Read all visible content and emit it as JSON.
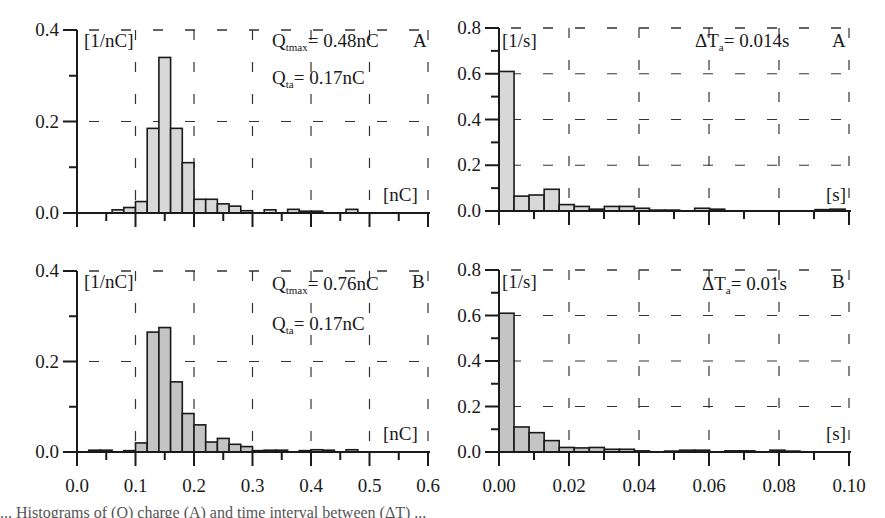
{
  "figure": {
    "caption_fragment": "... Histograms of (Q) charge (A) and time interval between (ΔT) ..."
  },
  "chart_data": [
    {
      "id": "A-charge",
      "type": "bar",
      "panel_letter": "A",
      "ylabel": "[1/nC]",
      "xlabel": "[nC]",
      "xlim": [
        0.0,
        0.6
      ],
      "ylim": [
        0.0,
        0.4
      ],
      "xticks": [
        "0.0",
        "0.1",
        "0.2",
        "0.3",
        "0.4",
        "0.5",
        "0.6"
      ],
      "yticks": [
        "0.0",
        "0.2",
        "0.4"
      ],
      "grid": "dashed",
      "bin_width": 0.02,
      "annotations": [
        {
          "symbol": "Q",
          "sub": "tmax",
          "text": "= 0.48nC"
        },
        {
          "symbol": "Q",
          "sub": "ta",
          "text": "= 0.17nC"
        }
      ],
      "bins_start": [
        0.06,
        0.08,
        0.1,
        0.12,
        0.14,
        0.16,
        0.18,
        0.2,
        0.22,
        0.24,
        0.26,
        0.28,
        0.32,
        0.36,
        0.38,
        0.4,
        0.46
      ],
      "values": [
        0.007,
        0.012,
        0.025,
        0.185,
        0.34,
        0.185,
        0.11,
        0.03,
        0.03,
        0.02,
        0.015,
        0.005,
        0.007,
        0.008,
        0.004,
        0.004,
        0.008
      ],
      "fill": "#d8d8d8"
    },
    {
      "id": "A-interval",
      "type": "bar",
      "panel_letter": "A",
      "ylabel": "[1/s]",
      "xlabel": "[s]",
      "xlim": [
        0.0,
        0.1
      ],
      "ylim": [
        0.0,
        0.8
      ],
      "xticks": [
        "0.00",
        "0.02",
        "0.04",
        "0.06",
        "0.08",
        "0.10"
      ],
      "yticks": [
        "0.0",
        "0.2",
        "0.4",
        "0.6",
        "0.8"
      ],
      "grid": "dashed",
      "bin_width": 0.0043,
      "annotations": [
        {
          "symbol": "ΔT",
          "sub": "a",
          "text": "= 0.014s"
        }
      ],
      "bins_start": [
        0.0,
        0.0043,
        0.0086,
        0.0129,
        0.0172,
        0.0215,
        0.0258,
        0.0301,
        0.0344,
        0.0387,
        0.043,
        0.0473,
        0.0559,
        0.0602,
        0.0903,
        0.0946
      ],
      "values": [
        0.61,
        0.065,
        0.07,
        0.095,
        0.028,
        0.02,
        0.008,
        0.02,
        0.02,
        0.012,
        0.004,
        0.004,
        0.012,
        0.008,
        0.006,
        0.008
      ],
      "fill": "#d8d8d8"
    },
    {
      "id": "B-charge",
      "type": "bar",
      "panel_letter": "B",
      "ylabel": "[1/nC]",
      "xlabel": "[nC]",
      "xlim": [
        0.0,
        0.6
      ],
      "ylim": [
        0.0,
        0.4
      ],
      "xticks": [
        "0.0",
        "0.1",
        "0.2",
        "0.3",
        "0.4",
        "0.5",
        "0.6"
      ],
      "yticks": [
        "0.0",
        "0.2",
        "0.4"
      ],
      "grid": "dashed",
      "bin_width": 0.02,
      "annotations": [
        {
          "symbol": "Q",
          "sub": "tmax",
          "text": "= 0.76nC"
        },
        {
          "symbol": "Q",
          "sub": "ta",
          "text": "= 0.17nC"
        }
      ],
      "bins_start": [
        0.02,
        0.04,
        0.08,
        0.1,
        0.12,
        0.14,
        0.16,
        0.18,
        0.2,
        0.22,
        0.24,
        0.26,
        0.28,
        0.3,
        0.32,
        0.34,
        0.38,
        0.4,
        0.42,
        0.46
      ],
      "values": [
        0.004,
        0.004,
        0.003,
        0.02,
        0.265,
        0.275,
        0.155,
        0.085,
        0.06,
        0.022,
        0.03,
        0.017,
        0.012,
        0.003,
        0.004,
        0.004,
        0.003,
        0.005,
        0.004,
        0.005
      ],
      "fill": "#c4c4c4"
    },
    {
      "id": "B-interval",
      "type": "bar",
      "panel_letter": "B",
      "ylabel": "[1/s]",
      "xlabel": "[s]",
      "xlim": [
        0.0,
        0.1
      ],
      "ylim": [
        0.0,
        0.8
      ],
      "xticks": [
        "0.00",
        "0.02",
        "0.04",
        "0.06",
        "0.08",
        "0.10"
      ],
      "yticks": [
        "0.0",
        "0.2",
        "0.4",
        "0.6",
        "0.8"
      ],
      "grid": "dashed",
      "bin_width": 0.0043,
      "annotations": [
        {
          "symbol": "ΔT",
          "sub": "a",
          "text": "= 0.01s"
        }
      ],
      "bins_start": [
        0.0,
        0.0043,
        0.0086,
        0.0129,
        0.0172,
        0.0215,
        0.0258,
        0.0301,
        0.0344,
        0.0387,
        0.0473,
        0.0516,
        0.0559,
        0.0645,
        0.0688,
        0.0774,
        0.0817
      ],
      "values": [
        0.61,
        0.11,
        0.085,
        0.05,
        0.02,
        0.018,
        0.02,
        0.012,
        0.012,
        0.005,
        0.004,
        0.008,
        0.008,
        0.005,
        0.005,
        0.008,
        0.004
      ],
      "fill": "#c4c4c4"
    }
  ]
}
